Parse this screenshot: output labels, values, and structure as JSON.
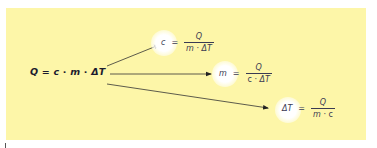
{
  "diagram": {
    "background_color": "#fdf6a8",
    "main_formula": {
      "lhs": "Q",
      "equals": "=",
      "terms": [
        "c",
        "·",
        "m",
        "·",
        "ΔT"
      ]
    },
    "derived_formulas": [
      {
        "lhs": "c",
        "equals": "=",
        "numerator": "Q",
        "denominator": [
          "m",
          " · ",
          "ΔT"
        ]
      },
      {
        "lhs": "m",
        "equals": "=",
        "numerator": "Q",
        "denominator": [
          "c",
          " · ",
          "ΔT"
        ]
      },
      {
        "lhs": "ΔT",
        "equals": "=",
        "numerator": "Q",
        "denominator": [
          "m",
          " · ",
          "c"
        ]
      }
    ],
    "arrows": [
      {
        "from": "main_formula",
        "to": "derived_formulas.0"
      },
      {
        "from": "main_formula",
        "to": "derived_formulas.1"
      },
      {
        "from": "main_formula",
        "to": "derived_formulas.2"
      }
    ]
  }
}
